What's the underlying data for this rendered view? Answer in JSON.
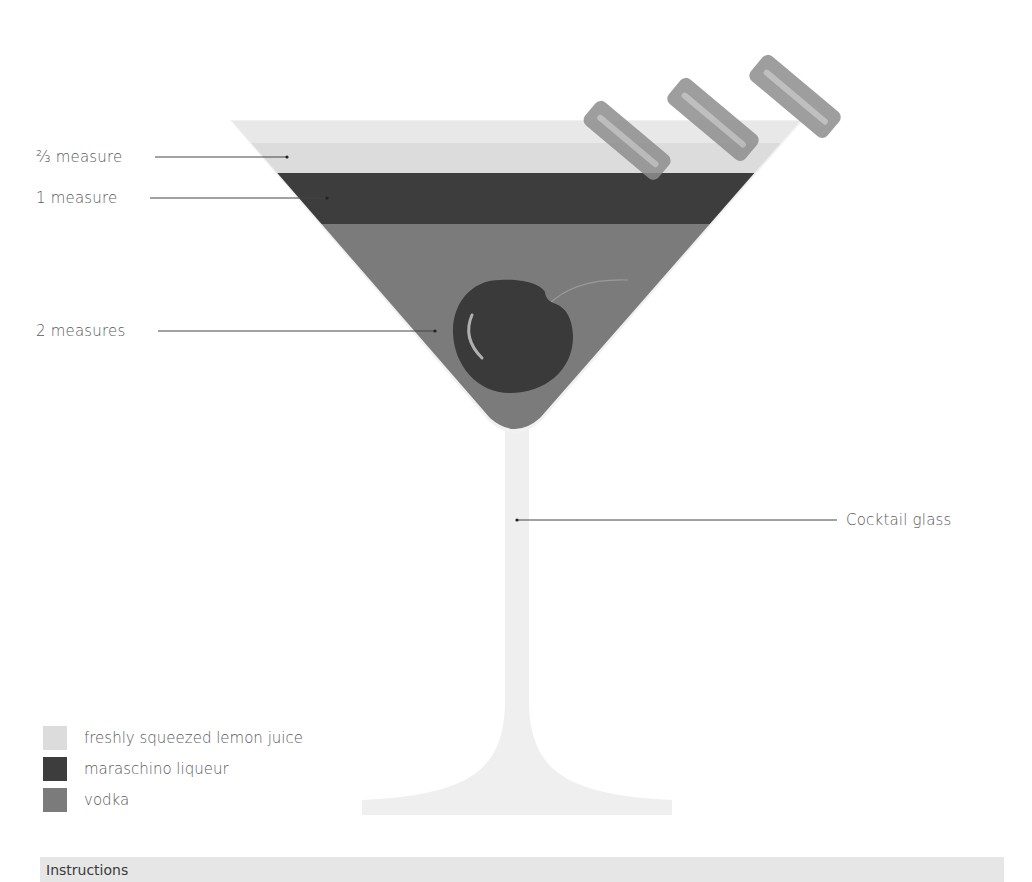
{
  "diagram": {
    "glass_label": "Cocktail glass",
    "layers": [
      {
        "name": "lemon",
        "measure_label": "⅔ measure",
        "color": "#dcdcdc"
      },
      {
        "name": "maraschino",
        "measure_label": "1 measure",
        "color": "#3d3d3d"
      },
      {
        "name": "vodka",
        "measure_label": "2 measures",
        "color": "#7b7b7b"
      }
    ],
    "garnish": [
      "cherry",
      "lemon peel twists (3)"
    ]
  },
  "legend": {
    "items": [
      {
        "label": "freshly squeezed lemon juice",
        "color": "#dcdcdc"
      },
      {
        "label": "maraschino liqueur",
        "color": "#3d3d3d"
      },
      {
        "label": "vodka",
        "color": "#7b7b7b"
      }
    ]
  },
  "instructions": {
    "title": "Instructions"
  }
}
